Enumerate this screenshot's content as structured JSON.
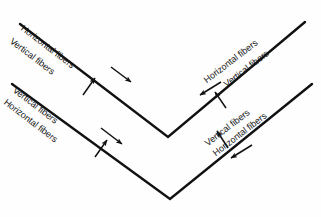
{
  "diagram": {
    "background_color": "#fefefe",
    "line_color": "#111111",
    "text_color": "#151515",
    "line_width_px": 2.4,
    "labels": {
      "horizontal_fibers": "Horizontal fibers",
      "vertical_fibers": "Vertical fibers"
    },
    "groups": [
      {
        "id": "top-left",
        "rotation_deg": 37.4,
        "items": [
          {
            "label": "Horizontal fibers",
            "arrow": "along-line-down-right",
            "arrow_glyph": "right-arrow-icon"
          },
          {
            "label": "Vertical fibers",
            "arrow": "perpendicular-up-right",
            "arrow_glyph": "up-arrow-icon"
          }
        ]
      },
      {
        "id": "bottom-left",
        "rotation_deg": 37.4,
        "items": [
          {
            "label": "Vertical fibers",
            "arrow": "perpendicular-up-right",
            "arrow_glyph": "up-arrow-icon"
          },
          {
            "label": "Horizontal fibers",
            "arrow": "along-line-down-right",
            "arrow_glyph": "right-arrow-icon"
          }
        ]
      },
      {
        "id": "top-right",
        "rotation_deg": -37.4,
        "items": [
          {
            "label": "Horizontal fibers",
            "arrow": "along-line-down-left",
            "arrow_glyph": "left-arrow-icon"
          },
          {
            "label": "Vertical fibers",
            "arrow": "perpendicular-up-left",
            "arrow_glyph": "up-arrow-icon"
          }
        ]
      },
      {
        "id": "bottom-right",
        "rotation_deg": -37.4,
        "items": [
          {
            "label": "Vertical fibers",
            "arrow": "perpendicular-up-left",
            "arrow_glyph": "up-arrow-icon"
          },
          {
            "label": "Horizontal fibers",
            "arrow": "along-line-down-left",
            "arrow_glyph": "left-arrow-icon"
          }
        ]
      }
    ],
    "chevrons": [
      {
        "id": "upper-chevron",
        "left_start": [
          20,
          24
        ],
        "vertex": [
          168,
          137
        ],
        "right_end": [
          305,
          22
        ]
      },
      {
        "id": "lower-chevron",
        "left_start": [
          12,
          84
        ],
        "vertex": [
          170,
          199
        ],
        "right_end": [
          312,
          84
        ]
      }
    ]
  }
}
